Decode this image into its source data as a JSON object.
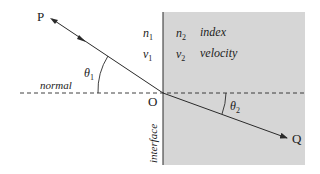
{
  "diagram": {
    "type": "refraction-at-interface",
    "colors": {
      "medium2_fill": "#d6d6d6",
      "line": "#2a2a2a",
      "background": "#ffffff"
    },
    "points": {
      "P": "P",
      "O": "O",
      "Q": "Q"
    },
    "angles": {
      "incident": "θ",
      "incident_sub": "1",
      "refracted": "θ",
      "refracted_sub": "2"
    },
    "labels": {
      "normal": "normal",
      "interface": "interface",
      "index_label": "index",
      "velocity_label": "velocity"
    },
    "medium1": {
      "n": "n",
      "n_sub": "1",
      "v": "v",
      "v_sub": "1"
    },
    "medium2": {
      "n": "n",
      "n_sub": "2",
      "v": "v",
      "v_sub": "2"
    }
  }
}
